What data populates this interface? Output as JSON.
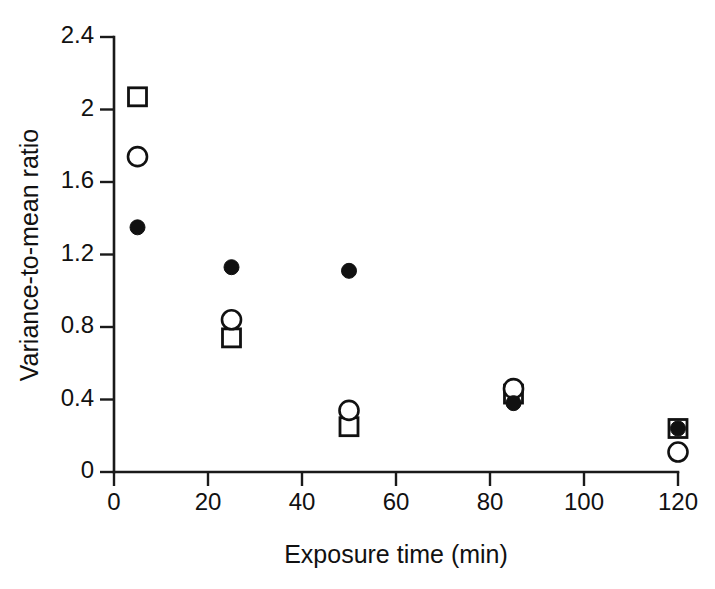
{
  "chart_data": {
    "type": "scatter",
    "title": "",
    "xlabel": "Exposure time (min)",
    "ylabel": "Variance-to-mean ratio",
    "xlim": [
      0,
      120
    ],
    "ylim": [
      0,
      2.4
    ],
    "xticks": [
      0,
      20,
      40,
      60,
      80,
      100,
      120
    ],
    "xtick_labels": [
      "0",
      "20",
      "40",
      "60",
      "80",
      "100",
      "120"
    ],
    "yticks": [
      0,
      0.4,
      0.8,
      1.2,
      1.6,
      2,
      2.4
    ],
    "ytick_labels": [
      "0",
      "0.4",
      "0.8",
      "1.2",
      "1.6",
      "2",
      "2.4"
    ],
    "grid": false,
    "legend": "none",
    "marker_color": "#111111",
    "axis_color": "#1a1a1a",
    "background": "#ffffff",
    "x": [
      5,
      25,
      50,
      85,
      120
    ],
    "series": [
      {
        "name": "open-square",
        "marker": "open-square",
        "values": [
          2.07,
          0.74,
          0.25,
          0.43,
          0.24
        ]
      },
      {
        "name": "open-circle",
        "marker": "open-circle",
        "values": [
          1.74,
          0.84,
          0.34,
          0.46,
          0.11
        ]
      },
      {
        "name": "filled-circle",
        "marker": "filled-circle",
        "values": [
          1.35,
          1.13,
          1.11,
          0.38,
          0.24
        ]
      }
    ]
  }
}
